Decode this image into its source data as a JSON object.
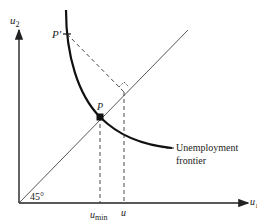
{
  "diagram": {
    "axes": {
      "x_label": "u",
      "x_label_sub": "1",
      "y_label": "u",
      "y_label_sub": "2"
    },
    "angle_label": "45°",
    "points": {
      "p": "P",
      "p_prime": "P′"
    },
    "x_ticks": {
      "u_min": "u",
      "u_min_sub": "min",
      "u": "u"
    },
    "curve_label_line1": "Unemployment",
    "curve_label_line2": "frontier"
  }
}
